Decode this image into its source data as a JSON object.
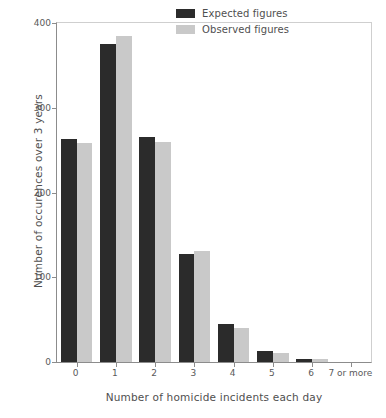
{
  "chart_data": {
    "type": "bar",
    "title": "",
    "xlabel": "Number of homicide incidents each day",
    "ylabel": "Number of occurences over 3 years",
    "categories": [
      "0",
      "1",
      "2",
      "3",
      "4",
      "5",
      "6",
      "7 or more"
    ],
    "series": [
      {
        "name": "Expected figures",
        "color": "#2b2b2b",
        "values": [
          263,
          375,
          265,
          127,
          45,
          13,
          4,
          0
        ]
      },
      {
        "name": "Observed figures",
        "color": "#c9c9c9",
        "values": [
          259,
          385,
          260,
          131,
          40,
          11,
          3,
          0
        ]
      }
    ],
    "ylim": [
      0,
      400
    ],
    "yticks": [
      0,
      100,
      200,
      300,
      400
    ],
    "ytick_labels": [
      "0",
      "100",
      "200",
      "300",
      "400"
    ],
    "grid": false,
    "legend_position": "top-right",
    "legend_entries": [
      "Expected figures",
      "Observed figures"
    ]
  },
  "axis": {
    "y_title": "Number of occurences over 3 years",
    "x_title": "Number of homicide incidents each day"
  },
  "colors": {
    "expected": "#2b2b2b",
    "observed": "#c9c9c9",
    "axis": "#8c8c8c",
    "text": "#4f4f4f",
    "background": "#ffffff"
  }
}
